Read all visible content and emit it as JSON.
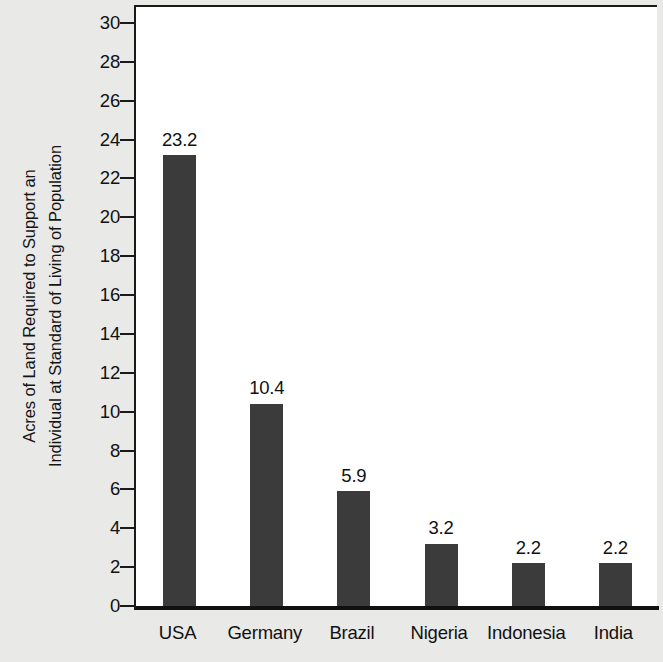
{
  "chart_data": {
    "type": "bar",
    "title": "",
    "subtitle": "",
    "xlabel": "",
    "ylabel_lines": [
      "Acres of Land Required to Support an",
      "Individual at Standard of Living of Population"
    ],
    "ylabel": "Acres of Land Required to Support an Individual at Standard of Living of Population",
    "categories": [
      "USA",
      "Germany",
      "Brazil",
      "Nigeria",
      "Indonesia",
      "India"
    ],
    "values": [
      23.2,
      10.4,
      5.9,
      3.2,
      2.2,
      2.2
    ],
    "value_labels": [
      "23.2",
      "10.4",
      "5.9",
      "3.2",
      "2.2",
      "2.2"
    ],
    "ylim": [
      0,
      30
    ],
    "ytick_values": [
      0,
      2,
      4,
      6,
      8,
      10,
      12,
      14,
      16,
      18,
      20,
      22,
      24,
      26,
      28,
      30
    ],
    "ytick_labels": [
      "0",
      "2",
      "4",
      "6",
      "8",
      "10",
      "12",
      "14",
      "16",
      "18",
      "20",
      "22",
      "24",
      "26",
      "28",
      "30"
    ],
    "ytick_step": 2,
    "grid": false,
    "legend": null,
    "legend_position": "none",
    "bar_color": "#3b3b3b",
    "plot_background": "#ffffff",
    "figure_background": "#e9e9e7",
    "axis_color": "#111111",
    "text_color": "#111111"
  }
}
